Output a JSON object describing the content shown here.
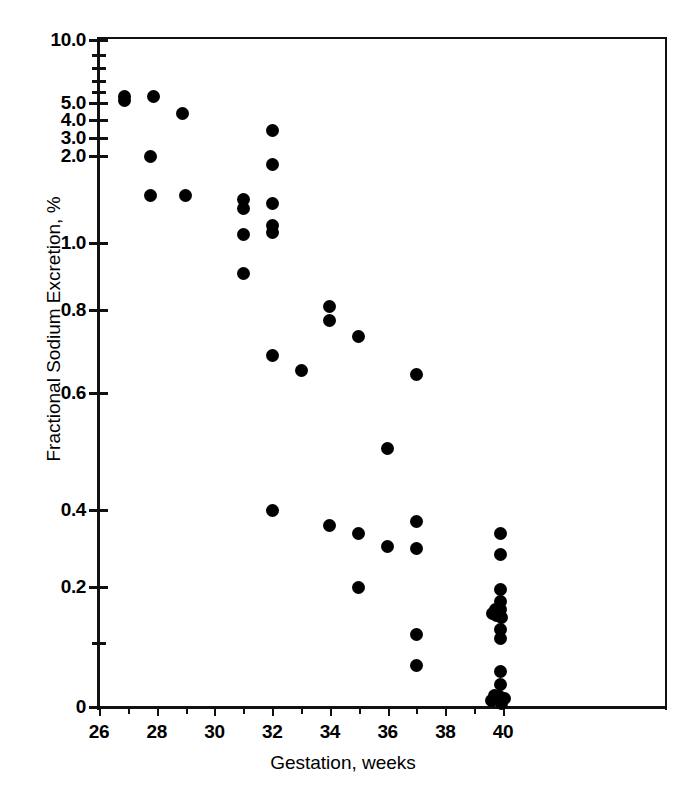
{
  "chart_data": {
    "type": "scatter",
    "title": "",
    "xlabel": "Gestation, weeks",
    "ylabel": "Fractional Sodium Excretion, %",
    "xlim": [
      26,
      41
    ],
    "ylim": [
      0,
      10
    ],
    "yscale": "nonlinear-probit",
    "grid": false,
    "legend": null,
    "x_tick_labels": [
      "26",
      "28",
      "30",
      "32",
      "34",
      "36",
      "38",
      "40"
    ],
    "x_tick_values": [
      26,
      28,
      30,
      32,
      34,
      36,
      38,
      40
    ],
    "x_minor_ticks": [
      27,
      29,
      31,
      33,
      35,
      37,
      39
    ],
    "y_tick_labels": [
      "10.0",
      "5.0",
      "4.0",
      "3.0",
      "2.0",
      "1.0",
      "0.8",
      "0.6",
      "0.4",
      "0.2",
      "0"
    ],
    "y_tick_values": [
      10.0,
      5.0,
      4.0,
      3.0,
      2.0,
      1.0,
      0.8,
      0.6,
      0.4,
      0.2,
      0
    ],
    "y_minor_tick_values": [
      9.0,
      8.0,
      7.0,
      6.0,
      0.1
    ],
    "marker": "filled-circle",
    "marker_color": "#000000",
    "points": [
      {
        "x": 26.9,
        "y": 5.6
      },
      {
        "x": 26.9,
        "y": 5.2
      },
      {
        "x": 27.9,
        "y": 5.6
      },
      {
        "x": 27.8,
        "y": 2.0
      },
      {
        "x": 27.8,
        "y": 1.55
      },
      {
        "x": 28.9,
        "y": 4.4
      },
      {
        "x": 29.0,
        "y": 1.55
      },
      {
        "x": 31.0,
        "y": 1.5
      },
      {
        "x": 31.0,
        "y": 1.4
      },
      {
        "x": 31.0,
        "y": 1.1
      },
      {
        "x": 31.0,
        "y": 0.91
      },
      {
        "x": 32.0,
        "y": 3.4
      },
      {
        "x": 32.0,
        "y": 1.9
      },
      {
        "x": 32.0,
        "y": 1.45
      },
      {
        "x": 32.0,
        "y": 1.2
      },
      {
        "x": 32.0,
        "y": 1.12
      },
      {
        "x": 32.0,
        "y": 0.69
      },
      {
        "x": 32.0,
        "y": 0.4
      },
      {
        "x": 33.0,
        "y": 0.655
      },
      {
        "x": 34.0,
        "y": 0.81
      },
      {
        "x": 34.0,
        "y": 0.775
      },
      {
        "x": 34.0,
        "y": 0.36
      },
      {
        "x": 35.0,
        "y": 0.735
      },
      {
        "x": 35.0,
        "y": 0.34
      },
      {
        "x": 35.0,
        "y": 0.2
      },
      {
        "x": 36.0,
        "y": 0.505
      },
      {
        "x": 36.0,
        "y": 0.305
      },
      {
        "x": 37.0,
        "y": 0.645
      },
      {
        "x": 37.0,
        "y": 0.37
      },
      {
        "x": 37.0,
        "y": 0.3
      },
      {
        "x": 37.0,
        "y": 0.115
      },
      {
        "x": 37.0,
        "y": 0.065
      },
      {
        "x": 39.9,
        "y": 0.34
      },
      {
        "x": 39.9,
        "y": 0.285
      },
      {
        "x": 39.9,
        "y": 0.195
      },
      {
        "x": 39.9,
        "y": 0.175
      },
      {
        "x": 39.75,
        "y": 0.16
      },
      {
        "x": 39.9,
        "y": 0.16
      },
      {
        "x": 39.62,
        "y": 0.152
      },
      {
        "x": 39.78,
        "y": 0.15
      },
      {
        "x": 39.95,
        "y": 0.145
      },
      {
        "x": 39.9,
        "y": 0.125
      },
      {
        "x": 39.9,
        "y": 0.108
      },
      {
        "x": 39.9,
        "y": 0.055
      },
      {
        "x": 39.9,
        "y": 0.035
      },
      {
        "x": 39.72,
        "y": 0.018
      },
      {
        "x": 39.88,
        "y": 0.016
      },
      {
        "x": 40.05,
        "y": 0.014
      },
      {
        "x": 39.6,
        "y": 0.01
      },
      {
        "x": 39.95,
        "y": 0.006
      }
    ]
  },
  "axes": {
    "y_title": "Fractional Sodium Excretion, %",
    "x_title": "Gestation, weeks"
  }
}
